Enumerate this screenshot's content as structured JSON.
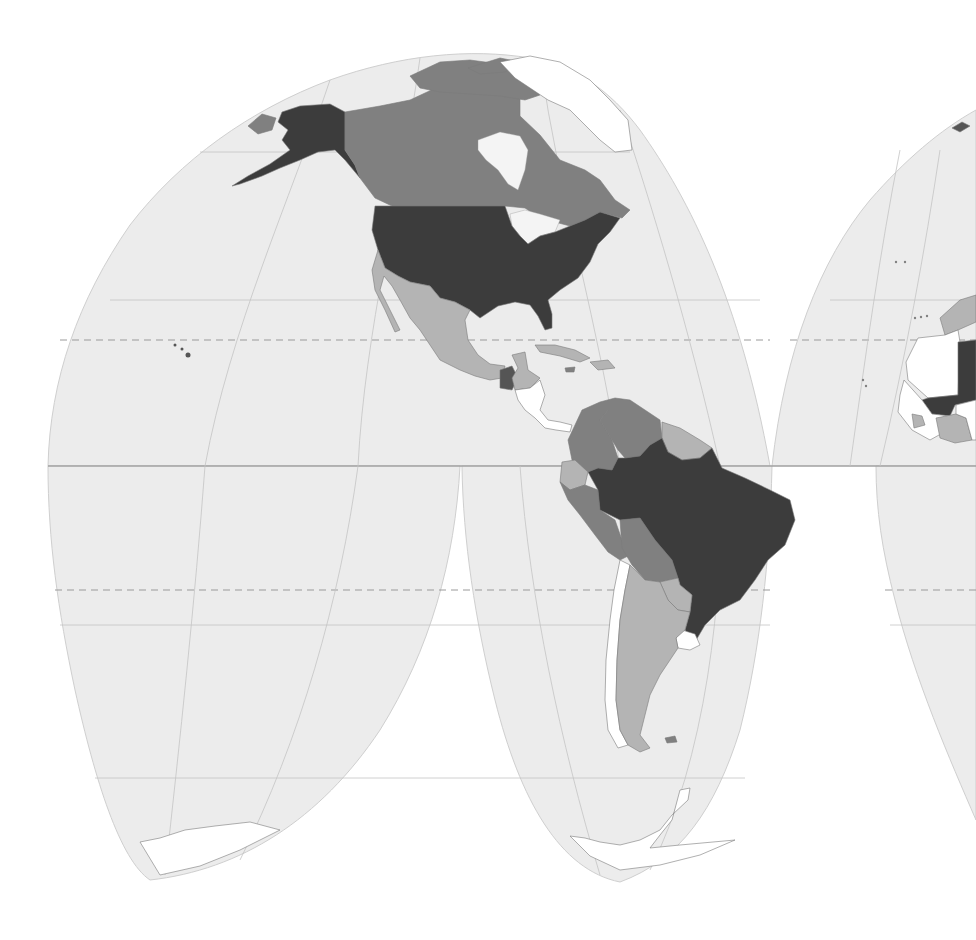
{
  "map": {
    "projection": "Goode homolosine (interrupted)",
    "type": "choropleth",
    "palette": {
      "ocean": "#ececec",
      "class_darkest": "#3c3c3c",
      "class_dark": "#555555",
      "class_medium": "#808080",
      "class_light": "#b4b4b4",
      "class_none": "#ffffff"
    },
    "regions": [
      {
        "name": "United States",
        "class": "darkest"
      },
      {
        "name": "Alaska",
        "class": "darkest"
      },
      {
        "name": "Brazil",
        "class": "darkest"
      },
      {
        "name": "Mali",
        "class": "darkest"
      },
      {
        "name": "Canada",
        "class": "medium"
      },
      {
        "name": "Russia (Chukotka)",
        "class": "medium"
      },
      {
        "name": "Colombia",
        "class": "medium"
      },
      {
        "name": "Venezuela",
        "class": "medium"
      },
      {
        "name": "Peru",
        "class": "medium"
      },
      {
        "name": "Bolivia",
        "class": "medium"
      },
      {
        "name": "Guatemala",
        "class": "dark"
      },
      {
        "name": "Mexico",
        "class": "light"
      },
      {
        "name": "Ecuador",
        "class": "light"
      },
      {
        "name": "Guyana / Suriname",
        "class": "light"
      },
      {
        "name": "Argentina",
        "class": "light"
      },
      {
        "name": "Paraguay",
        "class": "light"
      },
      {
        "name": "Cuba",
        "class": "light"
      },
      {
        "name": "Chile",
        "class": "none"
      },
      {
        "name": "Uruguay",
        "class": "none"
      },
      {
        "name": "Nicaragua / Costa Rica / Panama",
        "class": "none"
      },
      {
        "name": "Greenland",
        "class": "none"
      },
      {
        "name": "Mauritania",
        "class": "none"
      },
      {
        "name": "Senegal",
        "class": "none"
      },
      {
        "name": "Western Sahara",
        "class": "none"
      },
      {
        "name": "Morocco",
        "class": "light"
      },
      {
        "name": "Ivory Coast",
        "class": "light"
      },
      {
        "name": "Antarctica",
        "class": "none"
      }
    ],
    "graticule": {
      "equator": true,
      "tropics_dashed": true,
      "parallels_interval_deg": 20
    }
  }
}
